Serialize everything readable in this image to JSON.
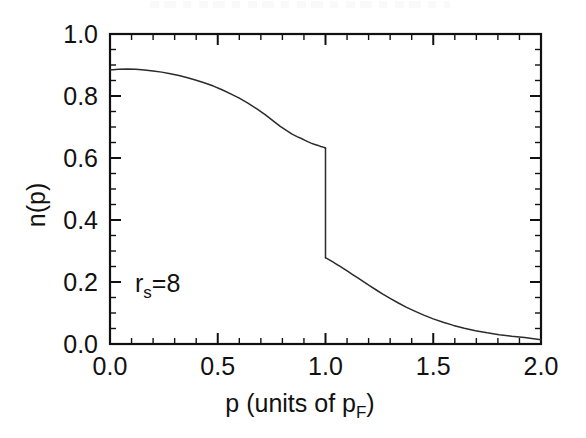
{
  "chart_data": {
    "type": "line",
    "title": "",
    "subtitle": "",
    "xlabel": "p (units of p_F)",
    "xlabel_main": "p (units of p",
    "xlabel_sub": "F",
    "xlabel_tail": ")",
    "ylabel": "n(p)",
    "xlim": [
      0.0,
      2.0
    ],
    "ylim": [
      0.0,
      1.0
    ],
    "grid": false,
    "legend": "none",
    "xticks": [
      0.0,
      0.5,
      1.0,
      1.5,
      2.0
    ],
    "xticklabels": [
      "0.0",
      "0.5",
      "1.0",
      "1.5",
      "2.0"
    ],
    "xminor_step": 0.1,
    "yticks": [
      0.0,
      0.2,
      0.4,
      0.6,
      0.8,
      1.0
    ],
    "yticklabels": [
      "0.0",
      "0.2",
      "0.4",
      "0.6",
      "0.8",
      "1.0"
    ],
    "yminor_step": 0.05,
    "annotations": [
      {
        "text": "r_s=8",
        "text_main": "r",
        "text_sub": "s",
        "text_tail": "=8",
        "x": 0.12,
        "y": 0.205
      }
    ],
    "discontinuity": {
      "x": 1.0,
      "y_above": 0.632,
      "y_below": 0.278,
      "jump": 0.354
    },
    "series": [
      {
        "name": "n(p)",
        "color": "#2b2b2b",
        "branch_below_kf": {
          "x": [
            0.0,
            0.04,
            0.08,
            0.12,
            0.16,
            0.2,
            0.24,
            0.28,
            0.32,
            0.36,
            0.4,
            0.44,
            0.48,
            0.52,
            0.56,
            0.6,
            0.64,
            0.68,
            0.72,
            0.76,
            0.8,
            0.83,
            0.86,
            0.88,
            0.9,
            0.92,
            0.935,
            0.95,
            0.962,
            0.972,
            0.98,
            0.986,
            0.991,
            0.995,
            0.998,
            1.0
          ],
          "y": [
            0.884,
            0.886,
            0.887,
            0.886,
            0.884,
            0.881,
            0.877,
            0.872,
            0.866,
            0.859,
            0.851,
            0.842,
            0.832,
            0.821,
            0.809,
            0.795,
            0.78,
            0.763,
            0.745,
            0.925,
            0.0,
            0.0,
            0.0,
            0.0,
            0.0,
            0.0,
            0.0,
            0.0,
            0.0,
            0.0,
            0.0,
            0.0,
            0.0,
            0.0,
            0.0,
            0.632
          ]
        },
        "x_below": [
          0.0,
          0.04,
          0.08,
          0.12,
          0.16,
          0.2,
          0.24,
          0.28,
          0.32,
          0.36,
          0.4,
          0.44,
          0.48,
          0.52,
          0.56,
          0.6,
          0.64,
          0.68,
          0.72,
          0.76,
          0.79,
          0.82,
          0.845,
          0.868,
          0.888,
          0.905,
          0.92,
          0.933,
          0.944,
          0.954,
          0.963,
          0.971,
          0.978,
          0.984,
          0.989,
          0.994,
          0.997,
          1.0
        ],
        "y_below": [
          0.884,
          0.886,
          0.887,
          0.886,
          0.884,
          0.881,
          0.877,
          0.872,
          0.866,
          0.859,
          0.851,
          0.842,
          0.832,
          0.82,
          0.807,
          0.793,
          0.777,
          0.759,
          0.74,
          0.718,
          0.702,
          0.688,
          0.677,
          0.669,
          0.663,
          0.657,
          0.652,
          0.648,
          0.645,
          0.643,
          0.641,
          0.639,
          0.637,
          0.636,
          0.635,
          0.634,
          0.633,
          0.632
        ],
        "x_above": [
          1.0,
          1.006,
          1.014,
          1.024,
          1.036,
          1.05,
          1.066,
          1.084,
          1.104,
          1.126,
          1.15,
          1.176,
          1.204,
          1.234,
          1.266,
          1.3,
          1.336,
          1.374,
          1.414,
          1.456,
          1.5,
          1.546,
          1.594,
          1.644,
          1.696,
          1.75,
          1.806,
          1.864,
          1.924,
          2.0
        ],
        "y_above": [
          0.278,
          0.276,
          0.273,
          0.269,
          0.264,
          0.258,
          0.251,
          0.243,
          0.234,
          0.224,
          0.213,
          0.201,
          0.188,
          0.175,
          0.161,
          0.147,
          0.133,
          0.119,
          0.106,
          0.093,
          0.081,
          0.07,
          0.06,
          0.051,
          0.043,
          0.036,
          0.03,
          0.025,
          0.021,
          0.014
        ]
      }
    ]
  },
  "figure": {
    "plot_left_px": 110,
    "plot_right_px": 541,
    "plot_top_px": 34,
    "plot_bottom_px": 344
  }
}
